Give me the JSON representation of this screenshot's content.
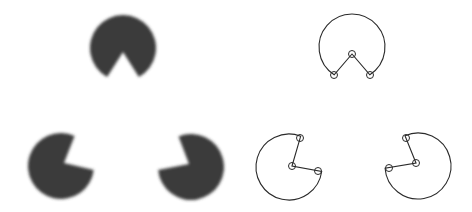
{
  "figure": {
    "colors": {
      "fill": "#3a3a3a",
      "stroke": "#2a2a2a",
      "background": "#ffffff"
    },
    "left_panel": {
      "pacmen": [
        {
          "id": "top",
          "cx": 123,
          "cy": 48,
          "r": 33,
          "notch": [
            [
              106,
              79
            ],
            [
              123,
              52
            ],
            [
              140,
              79
            ]
          ]
        },
        {
          "id": "bottom-left",
          "cx": 61,
          "cy": 166,
          "r": 33,
          "notch": [
            [
              75,
              135
            ],
            [
              64,
              163
            ],
            [
              94,
              170
            ]
          ]
        },
        {
          "id": "bottom-right",
          "cx": 191,
          "cy": 167,
          "r": 33,
          "notch": [
            [
              178,
              135
            ],
            [
              189,
              164
            ],
            [
              158,
              170
            ]
          ]
        }
      ]
    },
    "right_panel": {
      "outlines": [
        {
          "id": "top",
          "cx": 352,
          "cy": 47,
          "r": 33,
          "markers": [
            [
              334,
              75
            ],
            [
              352,
              54
            ],
            [
              370,
              75
            ]
          ]
        },
        {
          "id": "bottom-left",
          "cx": 289,
          "cy": 167,
          "r": 33,
          "markers": [
            [
              300,
              138
            ],
            [
              292,
              166
            ],
            [
              318,
              171
            ]
          ]
        },
        {
          "id": "bottom-right",
          "cx": 418,
          "cy": 166,
          "r": 33,
          "markers": [
            [
              406,
              138
            ],
            [
              416,
              163
            ],
            [
              389,
              168
            ]
          ]
        }
      ],
      "marker_radius": 3.5
    }
  }
}
